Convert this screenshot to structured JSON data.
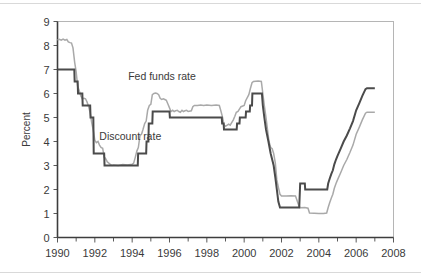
{
  "chart_data": {
    "type": "line",
    "title": "",
    "xlabel": "",
    "ylabel": "Percent",
    "xlim": [
      1990,
      2008
    ],
    "ylim": [
      0,
      9
    ],
    "grid": false,
    "legend_position": "inline-annotations",
    "x_ticks": [
      "1990",
      "1992",
      "1994",
      "1996",
      "1998",
      "2000",
      "2002",
      "2004",
      "2006",
      "2008"
    ],
    "x_tick_values": [
      1990,
      1992,
      1994,
      1996,
      1998,
      2000,
      2002,
      2004,
      2006,
      2008
    ],
    "x_minor_tick_values": [
      1991,
      1993,
      1995,
      1997,
      1999,
      2001,
      2003,
      2005,
      2007
    ],
    "y_ticks": [
      "0",
      "1",
      "2",
      "3",
      "4",
      "5",
      "6",
      "7",
      "8",
      "9"
    ],
    "y_tick_values": [
      0,
      1,
      2,
      3,
      4,
      5,
      6,
      7,
      8,
      9
    ],
    "series": [
      {
        "name": "Fed funds rate",
        "color": "#a9a9a9",
        "width": 1.5,
        "label_x": 1995.6,
        "label_y": 6.55,
        "points": [
          [
            1990.0,
            8.23
          ],
          [
            1990.1,
            8.26
          ],
          [
            1990.2,
            8.22
          ],
          [
            1990.3,
            8.27
          ],
          [
            1990.4,
            8.22
          ],
          [
            1990.5,
            8.25
          ],
          [
            1990.58,
            8.15
          ],
          [
            1990.67,
            8.12
          ],
          [
            1990.75,
            8.1
          ],
          [
            1990.83,
            7.9
          ],
          [
            1990.92,
            7.3
          ],
          [
            1991.0,
            6.9
          ],
          [
            1991.08,
            6.3
          ],
          [
            1991.17,
            6.1
          ],
          [
            1991.25,
            5.9
          ],
          [
            1991.33,
            5.78
          ],
          [
            1991.42,
            5.8
          ],
          [
            1991.5,
            5.78
          ],
          [
            1991.58,
            5.65
          ],
          [
            1991.67,
            5.45
          ],
          [
            1991.75,
            5.2
          ],
          [
            1991.83,
            4.8
          ],
          [
            1991.92,
            4.45
          ],
          [
            1992.0,
            4.05
          ],
          [
            1992.08,
            3.95
          ],
          [
            1992.17,
            4.0
          ],
          [
            1992.25,
            3.85
          ],
          [
            1992.33,
            3.75
          ],
          [
            1992.42,
            3.72
          ],
          [
            1992.5,
            3.35
          ],
          [
            1992.58,
            3.28
          ],
          [
            1992.67,
            3.15
          ],
          [
            1992.75,
            3.1
          ],
          [
            1992.83,
            3.05
          ],
          [
            1992.92,
            3.0
          ],
          [
            1993.0,
            3.02
          ],
          [
            1993.25,
            3.0
          ],
          [
            1993.5,
            3.04
          ],
          [
            1993.75,
            3.02
          ],
          [
            1994.0,
            3.05
          ],
          [
            1994.08,
            3.1
          ],
          [
            1994.17,
            3.35
          ],
          [
            1994.25,
            3.6
          ],
          [
            1994.33,
            3.75
          ],
          [
            1994.42,
            4.25
          ],
          [
            1994.5,
            4.3
          ],
          [
            1994.58,
            4.5
          ],
          [
            1994.67,
            4.75
          ],
          [
            1994.75,
            4.85
          ],
          [
            1994.83,
            5.3
          ],
          [
            1994.92,
            5.5
          ],
          [
            1995.0,
            5.55
          ],
          [
            1995.08,
            5.95
          ],
          [
            1995.17,
            6.0
          ],
          [
            1995.25,
            6.02
          ],
          [
            1995.33,
            6.0
          ],
          [
            1995.42,
            5.95
          ],
          [
            1995.5,
            5.8
          ],
          [
            1995.58,
            5.75
          ],
          [
            1995.67,
            5.78
          ],
          [
            1995.75,
            5.75
          ],
          [
            1995.83,
            5.72
          ],
          [
            1995.92,
            5.55
          ],
          [
            1996.0,
            5.4
          ],
          [
            1996.08,
            5.25
          ],
          [
            1996.17,
            5.3
          ],
          [
            1996.25,
            5.25
          ],
          [
            1996.33,
            5.28
          ],
          [
            1996.42,
            5.3
          ],
          [
            1996.5,
            5.25
          ],
          [
            1996.58,
            5.22
          ],
          [
            1996.67,
            5.3
          ],
          [
            1996.75,
            5.25
          ],
          [
            1996.83,
            5.28
          ],
          [
            1996.92,
            5.3
          ],
          [
            1997.0,
            5.25
          ],
          [
            1997.17,
            5.28
          ],
          [
            1997.25,
            5.45
          ],
          [
            1997.33,
            5.5
          ],
          [
            1997.5,
            5.5
          ],
          [
            1997.67,
            5.52
          ],
          [
            1997.83,
            5.5
          ],
          [
            1998.0,
            5.52
          ],
          [
            1998.25,
            5.5
          ],
          [
            1998.5,
            5.52
          ],
          [
            1998.67,
            5.5
          ],
          [
            1998.75,
            5.28
          ],
          [
            1998.83,
            5.05
          ],
          [
            1998.92,
            4.7
          ],
          [
            1999.0,
            4.63
          ],
          [
            1999.17,
            4.72
          ],
          [
            1999.25,
            4.68
          ],
          [
            1999.42,
            4.9
          ],
          [
            1999.5,
            5.05
          ],
          [
            1999.58,
            5.22
          ],
          [
            1999.67,
            5.25
          ],
          [
            1999.83,
            5.45
          ],
          [
            2000.0,
            5.5
          ],
          [
            2000.08,
            5.7
          ],
          [
            2000.25,
            5.95
          ],
          [
            2000.33,
            6.2
          ],
          [
            2000.42,
            6.45
          ],
          [
            2000.5,
            6.5
          ],
          [
            2000.75,
            6.52
          ],
          [
            2000.92,
            6.5
          ],
          [
            2001.0,
            6.0
          ],
          [
            2001.08,
            5.5
          ],
          [
            2001.17,
            5.0
          ],
          [
            2001.25,
            4.5
          ],
          [
            2001.33,
            4.0
          ],
          [
            2001.42,
            3.75
          ],
          [
            2001.5,
            3.7
          ],
          [
            2001.58,
            3.5
          ],
          [
            2001.67,
            3.1
          ],
          [
            2001.75,
            2.4
          ],
          [
            2001.83,
            2.1
          ],
          [
            2001.92,
            1.8
          ],
          [
            2002.0,
            1.73
          ],
          [
            2002.25,
            1.73
          ],
          [
            2002.5,
            1.74
          ],
          [
            2002.75,
            1.73
          ],
          [
            2002.92,
            1.35
          ],
          [
            2003.0,
            1.24
          ],
          [
            2003.25,
            1.25
          ],
          [
            2003.42,
            1.22
          ],
          [
            2003.5,
            1.02
          ],
          [
            2003.75,
            1.01
          ],
          [
            2004.0,
            1.0
          ],
          [
            2004.25,
            1.0
          ],
          [
            2004.42,
            1.02
          ],
          [
            2004.5,
            1.25
          ],
          [
            2004.58,
            1.45
          ],
          [
            2004.67,
            1.65
          ],
          [
            2004.75,
            1.8
          ],
          [
            2004.83,
            2.05
          ],
          [
            2004.92,
            2.25
          ],
          [
            2005.0,
            2.4
          ],
          [
            2005.17,
            2.7
          ],
          [
            2005.33,
            3.0
          ],
          [
            2005.5,
            3.25
          ],
          [
            2005.67,
            3.55
          ],
          [
            2005.83,
            3.85
          ],
          [
            2006.0,
            4.3
          ],
          [
            2006.17,
            4.6
          ],
          [
            2006.33,
            4.9
          ],
          [
            2006.5,
            5.18
          ],
          [
            2006.58,
            5.22
          ],
          [
            2006.75,
            5.22
          ],
          [
            2007.0,
            5.22
          ]
        ]
      },
      {
        "name": "Discount rate",
        "color": "#4b4b4b",
        "width": 2.0,
        "label_x": 1993.9,
        "label_y": 4.05,
        "points": [
          [
            1990.0,
            7.0
          ],
          [
            1990.9,
            7.0
          ],
          [
            1990.92,
            6.5
          ],
          [
            1991.08,
            6.5
          ],
          [
            1991.1,
            6.0
          ],
          [
            1991.33,
            6.0
          ],
          [
            1991.35,
            5.5
          ],
          [
            1991.75,
            5.5
          ],
          [
            1991.77,
            5.0
          ],
          [
            1991.92,
            5.0
          ],
          [
            1991.94,
            3.5
          ],
          [
            1992.5,
            3.5
          ],
          [
            1992.52,
            3.0
          ],
          [
            1994.3,
            3.0
          ],
          [
            1994.32,
            3.5
          ],
          [
            1994.75,
            3.5
          ],
          [
            1994.77,
            4.0
          ],
          [
            1994.87,
            4.0
          ],
          [
            1994.89,
            4.75
          ],
          [
            1995.08,
            4.75
          ],
          [
            1995.1,
            5.25
          ],
          [
            1996.0,
            5.25
          ],
          [
            1996.02,
            5.0
          ],
          [
            1998.8,
            5.0
          ],
          [
            1998.82,
            4.75
          ],
          [
            1998.9,
            4.75
          ],
          [
            1998.92,
            4.5
          ],
          [
            1999.6,
            4.5
          ],
          [
            1999.62,
            4.75
          ],
          [
            1999.75,
            4.75
          ],
          [
            1999.77,
            5.0
          ],
          [
            2000.08,
            5.0
          ],
          [
            2000.1,
            5.25
          ],
          [
            2000.3,
            5.25
          ],
          [
            2000.32,
            5.5
          ],
          [
            2000.42,
            5.5
          ],
          [
            2000.44,
            6.0
          ],
          [
            2000.95,
            6.0
          ],
          [
            2001.0,
            5.5
          ],
          [
            2001.08,
            5.0
          ],
          [
            2001.17,
            4.5
          ],
          [
            2001.3,
            4.0
          ],
          [
            2001.42,
            3.5
          ],
          [
            2001.5,
            3.25
          ],
          [
            2001.58,
            3.0
          ],
          [
            2001.67,
            2.5
          ],
          [
            2001.75,
            2.0
          ],
          [
            2001.83,
            1.5
          ],
          [
            2001.92,
            1.25
          ],
          [
            2002.0,
            1.25
          ],
          [
            2002.95,
            1.25
          ],
          [
            2003.0,
            2.25
          ],
          [
            2003.25,
            2.25
          ],
          [
            2003.27,
            2.0
          ],
          [
            2004.45,
            2.0
          ],
          [
            2004.5,
            2.25
          ],
          [
            2004.58,
            2.45
          ],
          [
            2004.67,
            2.65
          ],
          [
            2004.75,
            2.8
          ],
          [
            2004.83,
            3.05
          ],
          [
            2004.92,
            3.25
          ],
          [
            2005.0,
            3.4
          ],
          [
            2005.17,
            3.7
          ],
          [
            2005.33,
            4.0
          ],
          [
            2005.5,
            4.25
          ],
          [
            2005.67,
            4.55
          ],
          [
            2005.83,
            4.85
          ],
          [
            2006.0,
            5.3
          ],
          [
            2006.17,
            5.6
          ],
          [
            2006.33,
            5.9
          ],
          [
            2006.5,
            6.18
          ],
          [
            2006.58,
            6.22
          ],
          [
            2006.75,
            6.22
          ],
          [
            2007.0,
            6.22
          ]
        ]
      }
    ]
  }
}
